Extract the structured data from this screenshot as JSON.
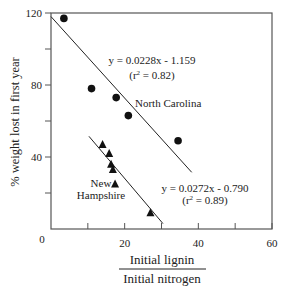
{
  "chart_data": {
    "type": "scatter",
    "title": "",
    "xlabel_numerator": "Initial lignin",
    "xlabel_denominator": "Initial nitrogen",
    "ylabel": "% weight lost in first year",
    "xlim": [
      0,
      60
    ],
    "ylim": [
      0,
      120
    ],
    "x_ticks": [
      0,
      10,
      20,
      30,
      40,
      50,
      60
    ],
    "x_tick_labels": [
      "0",
      "",
      "20",
      "",
      "40",
      "",
      "60"
    ],
    "y_ticks": [
      0,
      20,
      40,
      60,
      80,
      100,
      120
    ],
    "y_tick_labels": [
      "0",
      "",
      "40",
      "",
      "80",
      "",
      "120"
    ],
    "grid": false,
    "series": [
      {
        "name": "North Carolina",
        "marker": "circle",
        "points": [
          {
            "x": 3.5,
            "y": 117
          },
          {
            "x": 11,
            "y": 78
          },
          {
            "x": 17.7,
            "y": 73
          },
          {
            "x": 21,
            "y": 63
          },
          {
            "x": 34.5,
            "y": 49
          }
        ],
        "fit": {
          "equation": "y = 0.0228x - 1.159",
          "r2_label": "(r",
          "r2_value": " = 0.82)",
          "line": [
            {
              "x": 0,
              "y": 118
            },
            {
              "x": 38.2,
              "y": 31.5
            }
          ]
        },
        "label": "North Carolina"
      },
      {
        "name": "New Hampshire",
        "marker": "triangle",
        "points": [
          {
            "x": 14,
            "y": 47
          },
          {
            "x": 15.8,
            "y": 42
          },
          {
            "x": 16.3,
            "y": 36
          },
          {
            "x": 16.8,
            "y": 33
          },
          {
            "x": 17.4,
            "y": 25
          },
          {
            "x": 27,
            "y": 9
          }
        ],
        "fit": {
          "equation": "y = 0.0272x - 0.790",
          "r2_label": "(r",
          "r2_value": " = 0.89)",
          "line": [
            {
              "x": 10.3,
              "y": 51.5
            },
            {
              "x": 30.4,
              "y": 3
            }
          ]
        },
        "label_line1": "New",
        "label_line2": "Hampshire"
      }
    ]
  }
}
